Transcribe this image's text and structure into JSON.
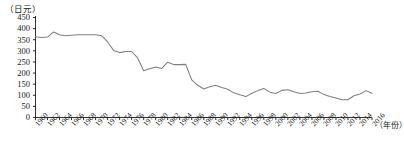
{
  "chart_data": {
    "type": "line",
    "title": "",
    "subtitle": "",
    "unit_label": "（日元）",
    "xlabel": "（年份）",
    "ylabel": "",
    "ylim": [
      0,
      450
    ],
    "xlim": [
      1960,
      2016
    ],
    "grid": false,
    "legend": null,
    "y_ticks": [
      0,
      50,
      100,
      150,
      200,
      250,
      300,
      350,
      400,
      450
    ],
    "x_ticks": [
      1960,
      1962,
      1964,
      1966,
      1968,
      1970,
      1972,
      1974,
      1976,
      1978,
      1980,
      1982,
      1984,
      1986,
      1988,
      1990,
      1992,
      1994,
      1996,
      1998,
      2000,
      2002,
      2004,
      2006,
      2008,
      2010,
      2012,
      2014,
      2016
    ],
    "line_color": "#808080",
    "axis_color": "#1a1a1a",
    "x": [
      1960,
      1961,
      1962,
      1963,
      1964,
      1965,
      1966,
      1967,
      1968,
      1969,
      1970,
      1971,
      1972,
      1973,
      1974,
      1975,
      1976,
      1977,
      1978,
      1979,
      1980,
      1981,
      1982,
      1983,
      1984,
      1985,
      1986,
      1987,
      1988,
      1989,
      1990,
      1991,
      1992,
      1993,
      1994,
      1995,
      1996,
      1997,
      1998,
      1999,
      2000,
      2001,
      2002,
      2003,
      2004,
      2005,
      2006,
      2007,
      2008,
      2009,
      2010,
      2011,
      2012,
      2013,
      2014,
      2015,
      2016
    ],
    "values": [
      363,
      360,
      362,
      385,
      372,
      368,
      370,
      372,
      372,
      372,
      372,
      368,
      340,
      302,
      292,
      297,
      297,
      268,
      210,
      219,
      227,
      221,
      249,
      238,
      238,
      239,
      169,
      145,
      128,
      138,
      145,
      135,
      127,
      111,
      102,
      94,
      109,
      121,
      131,
      114,
      108,
      122,
      125,
      116,
      108,
      110,
      116,
      118,
      103,
      94,
      88,
      80,
      80,
      98,
      106,
      121,
      109
    ]
  }
}
